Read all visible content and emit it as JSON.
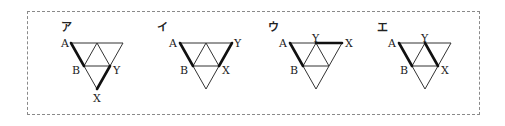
{
  "figures": [
    {
      "id": "a",
      "label": "ア",
      "origin": [
        71,
        43
      ],
      "points": {
        "A": "A",
        "B": "B",
        "X": "X",
        "Y": "Y"
      },
      "label_positions": {
        "A": "top-left",
        "B": "left-mid",
        "Y": "right-mid",
        "X": "bottom-apex"
      },
      "path": "A-B, Y-X (bold)"
    },
    {
      "id": "i",
      "label": "イ",
      "origin": [
        181,
        43
      ],
      "points": {
        "A": "A",
        "B": "B",
        "X": "X",
        "Y": "Y"
      },
      "label_positions": {
        "A": "top-left",
        "B": "left-mid",
        "X": "right-mid",
        "Y": "top-right"
      },
      "path": "A-B, X-Y (bold)"
    },
    {
      "id": "u",
      "label": "ウ",
      "origin": [
        291,
        43
      ],
      "points": {
        "A": "A",
        "B": "B",
        "X": "X",
        "Y": "Y"
      },
      "label_positions": {
        "A": "top-left",
        "B": "left-mid",
        "Y": "top-mid",
        "X": "top-right"
      },
      "path": "A-B, Y-X (bold)"
    },
    {
      "id": "e",
      "label": "エ",
      "origin": [
        401,
        43
      ],
      "points": {
        "A": "A",
        "B": "B",
        "X": "X",
        "Y": "Y"
      },
      "label_positions": {
        "A": "top-left",
        "B": "left-mid",
        "Y": "top-mid",
        "X": "right-mid"
      },
      "path": "A-B, Y-X (bold)"
    }
  ]
}
